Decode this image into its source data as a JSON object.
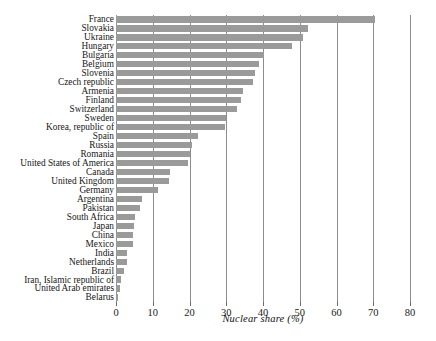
{
  "chart_data": {
    "type": "bar",
    "orientation": "horizontal",
    "title": "",
    "xlabel": "Nuclear share (%)",
    "ylabel": "",
    "xlim": [
      0,
      80
    ],
    "xticks": [
      0,
      10,
      20,
      30,
      40,
      50,
      60,
      70,
      80
    ],
    "grid": true,
    "legend": false,
    "bar_color": "#9a9a9a",
    "background_color": "#ffffff",
    "categories": [
      "France",
      "Slovakia",
      "Ukraine",
      "Hungary",
      "Bulgaria",
      "Belgium",
      "Slovenia",
      "Czech republic",
      "Armenia",
      "Finland",
      "Switzerland",
      "Sweden",
      "Korea, republic of",
      "Spain",
      "Russia",
      "Romania",
      "United States of America",
      "Canada",
      "United Kingdom",
      "Germany",
      "Argentina",
      "Pakistan",
      "South Africa",
      "Japan",
      "China",
      "Mexico",
      "India",
      "Netherlands",
      "Brazil",
      "Iran, Islamic republic of",
      "United Arab emirates",
      "Belarus"
    ],
    "values": [
      70.6,
      52.3,
      51.0,
      48.0,
      40.2,
      39.0,
      37.8,
      37.3,
      34.5,
      33.9,
      33.0,
      29.8,
      29.6,
      22.2,
      20.6,
      20.2,
      19.6,
      14.6,
      14.5,
      11.3,
      7.2,
      6.6,
      5.2,
      4.8,
      4.6,
      4.5,
      3.1,
      3.1,
      2.1,
      1.4,
      1.1,
      0.6
    ]
  }
}
